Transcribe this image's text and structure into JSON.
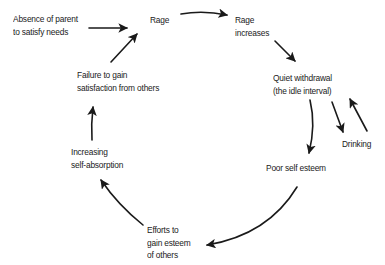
{
  "diagram": {
    "title": "",
    "type": "cycle",
    "nodes": [
      {
        "id": "absence",
        "lines": [
          "Absence of parent",
          "to satisfy needs"
        ]
      },
      {
        "id": "rage",
        "lines": [
          "Rage"
        ]
      },
      {
        "id": "rage_increases",
        "lines": [
          "Rage",
          "increases"
        ]
      },
      {
        "id": "quiet_withdrawal",
        "lines": [
          "Quiet withdrawal",
          "(the idle interval)"
        ]
      },
      {
        "id": "drinking",
        "lines": [
          "Drinking"
        ]
      },
      {
        "id": "poor_self_esteem",
        "lines": [
          "Poor self esteem"
        ]
      },
      {
        "id": "efforts",
        "lines": [
          "Efforts to",
          "gain esteem",
          "of others"
        ]
      },
      {
        "id": "self_absorption",
        "lines": [
          "Increasing",
          "self-absorption"
        ]
      },
      {
        "id": "failure",
        "lines": [
          "Failure to gain",
          "satisfaction from others"
        ]
      }
    ],
    "edges": [
      {
        "from": "absence",
        "to": "rage"
      },
      {
        "from": "rage",
        "to": "rage_increases"
      },
      {
        "from": "rage_increases",
        "to": "quiet_withdrawal"
      },
      {
        "from": "quiet_withdrawal",
        "to": "drinking"
      },
      {
        "from": "drinking",
        "to": "quiet_withdrawal"
      },
      {
        "from": "quiet_withdrawal",
        "to": "poor_self_esteem"
      },
      {
        "from": "poor_self_esteem",
        "to": "efforts"
      },
      {
        "from": "efforts",
        "to": "self_absorption"
      },
      {
        "from": "self_absorption",
        "to": "failure"
      },
      {
        "from": "failure",
        "to": "rage"
      }
    ],
    "colors": {
      "background": "#ffffff",
      "ink": "#1a1a1a"
    }
  }
}
